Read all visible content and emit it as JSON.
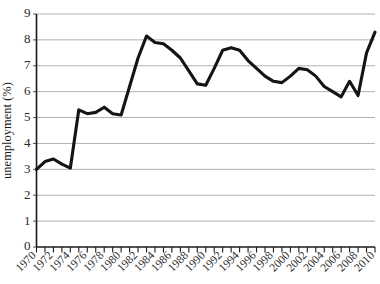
{
  "chart_data": {
    "type": "line",
    "title": "",
    "xlabel": "",
    "ylabel": "unemployment (%)",
    "ylim": [
      0,
      9
    ],
    "xlim": [
      1970,
      2010
    ],
    "grid": true,
    "legend": "none",
    "y_ticks": [
      0,
      1,
      2,
      3,
      4,
      5,
      6,
      7,
      8,
      9
    ],
    "y_tick_labels": [
      "0",
      "1",
      "2",
      "3",
      "4",
      "5",
      "6",
      "7",
      "8",
      "9"
    ],
    "x_tick_labels": [
      "1970",
      "1972",
      "1974",
      "1976",
      "1978",
      "1980",
      "1982",
      "1984",
      "1986",
      "1988",
      "1990",
      "1992",
      "1994",
      "1996",
      "1998",
      "2000",
      "2002",
      "2004",
      "2006",
      "2008",
      "2010"
    ],
    "x_tick_label_step": 2,
    "x_minor_tick_step": 1,
    "x_tick_label_rotation": -45,
    "series_color": "#141414",
    "grid_color": "#a8a8a8",
    "x": [
      1970,
      1971,
      1972,
      1973,
      1974,
      1975,
      1976,
      1977,
      1978,
      1979,
      1980,
      1981,
      1982,
      1983,
      1984,
      1985,
      1986,
      1987,
      1988,
      1989,
      1990,
      1991,
      1992,
      1993,
      1994,
      1995,
      1996,
      1997,
      1998,
      1999,
      2000,
      2001,
      2002,
      2003,
      2004,
      2005,
      2006,
      2007,
      2008,
      2009,
      2010
    ],
    "values": [
      3.0,
      3.3,
      3.4,
      3.2,
      3.05,
      5.3,
      5.15,
      5.2,
      5.4,
      5.15,
      5.1,
      6.2,
      7.3,
      8.15,
      7.9,
      7.85,
      7.6,
      7.3,
      6.8,
      6.3,
      6.25,
      6.9,
      7.6,
      7.7,
      7.6,
      7.2,
      6.9,
      6.6,
      6.4,
      6.35,
      6.6,
      6.9,
      6.85,
      6.6,
      6.2,
      6.0,
      5.8,
      6.4,
      5.85,
      7.5,
      8.3
    ],
    "series": [
      {
        "name": "unemployment rate",
        "values": [
          3.0,
          3.3,
          3.4,
          3.2,
          3.05,
          5.3,
          5.15,
          5.2,
          5.4,
          5.15,
          5.1,
          6.2,
          7.3,
          8.15,
          7.9,
          7.85,
          7.6,
          7.3,
          6.8,
          6.3,
          6.25,
          6.9,
          7.6,
          7.7,
          7.6,
          7.2,
          6.9,
          6.6,
          6.4,
          6.35,
          6.6,
          6.9,
          6.85,
          6.6,
          6.2,
          6.0,
          5.8,
          6.4,
          5.85,
          7.5,
          8.3
        ]
      }
    ],
    "annotations": []
  }
}
